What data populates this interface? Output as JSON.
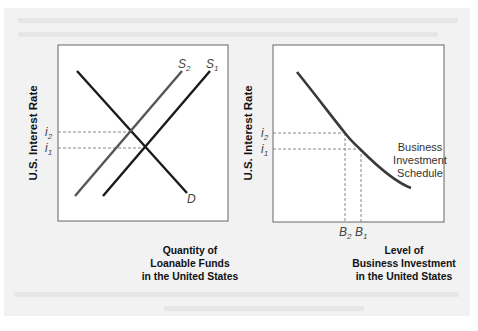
{
  "figure": {
    "left_panel": {
      "y_axis_label": "U.S. Interest Rate",
      "x_axis_label_lines": [
        "Quantity of",
        "Loanable Funds",
        "in the United States"
      ],
      "curves": {
        "demand": {
          "label": "D"
        },
        "supply_1": {
          "label": "S",
          "sub": "1"
        },
        "supply_2": {
          "label": "S",
          "sub": "2"
        }
      },
      "ticks": {
        "i2": {
          "label": "i",
          "sub": "2"
        },
        "i1": {
          "label": "i",
          "sub": "1"
        }
      }
    },
    "right_panel": {
      "y_axis_label": "U.S. Interest Rate",
      "x_axis_label_lines": [
        "Level of",
        "Business Investment",
        "in the United States"
      ],
      "curve_label_lines": [
        "Business",
        "Investment",
        "Schedule"
      ],
      "ticks": {
        "i2": {
          "label": "i",
          "sub": "2"
        },
        "i1": {
          "label": "i",
          "sub": "1"
        },
        "B2": {
          "label": "B",
          "sub": "2"
        },
        "B1": {
          "label": "B",
          "sub": "1"
        }
      }
    }
  },
  "colors": {
    "line": "#1a1a1a",
    "supply2": "#555555",
    "dashed": "#888888",
    "page_bg": "#f2f2f2"
  }
}
